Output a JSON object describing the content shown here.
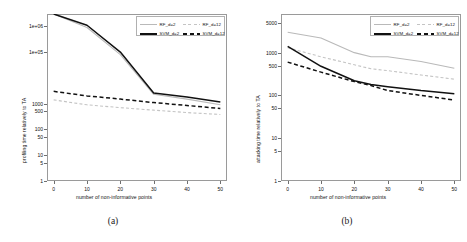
{
  "figure": {
    "panels": [
      {
        "caption": "(a)",
        "xlabel": "number of non-informative points",
        "ylabel": "profiling time relatively to TA",
        "xticks": [
          "0",
          "10",
          "20",
          "30",
          "40",
          "50"
        ],
        "yticks": [
          "1",
          "5",
          "10",
          "50",
          "100",
          "500",
          "1000",
          "1e+05",
          "1e+06"
        ]
      },
      {
        "caption": "(b)",
        "xlabel": "number of non-informative points",
        "ylabel": "attacking time relatively to TA",
        "xticks": [
          "0",
          "10",
          "20",
          "30",
          "40",
          "50"
        ],
        "yticks": [
          "1",
          "5",
          "10",
          "50",
          "100",
          "500",
          "1000",
          "5000"
        ]
      }
    ],
    "legend": {
      "entries": [
        {
          "label": "RF_d=2",
          "color": "#b9b9b9",
          "style": "solid"
        },
        {
          "label": "RF_d=12",
          "color": "#c4c4c4",
          "style": "dashed"
        },
        {
          "label": "SVM_d=2",
          "color": "#111111",
          "style": "solid"
        },
        {
          "label": "SVM_d=12",
          "color": "#111111",
          "style": "dashed"
        }
      ]
    }
  },
  "chart_data": [
    {
      "type": "line",
      "title": "(a)",
      "xlabel": "number of non-informative points",
      "ylabel": "profiling time relatively to TA",
      "xlim": [
        -2,
        52
      ],
      "ylim": [
        1,
        3000000
      ],
      "yscale": "log",
      "grid": false,
      "legend_position": "top-right",
      "x": [
        0,
        10,
        20,
        30,
        40,
        50
      ],
      "series": [
        {
          "name": "RF_d=2",
          "color": "#b9b9b9",
          "style": "solid",
          "values": [
            3000000,
            900000,
            80000,
            2300,
            1500,
            900
          ]
        },
        {
          "name": "RF_d=12",
          "color": "#c4c4c4",
          "style": "dashed",
          "values": [
            1400,
            900,
            700,
            560,
            450,
            380
          ]
        },
        {
          "name": "SVM_d=2",
          "color": "#111111",
          "style": "solid",
          "values": [
            3000000,
            1100000,
            100000,
            2600,
            1800,
            1150
          ]
        },
        {
          "name": "SVM_d=12",
          "color": "#111111",
          "style": "dashed",
          "values": [
            3000,
            2000,
            1500,
            1100,
            850,
            650
          ]
        }
      ]
    },
    {
      "type": "line",
      "title": "(b)",
      "xlabel": "number of non-informative points",
      "ylabel": "attacking time relatively to TA",
      "xlim": [
        -2,
        52
      ],
      "ylim": [
        1,
        8000
      ],
      "yscale": "log",
      "grid": false,
      "legend_position": "top-right",
      "x": [
        0,
        10,
        20,
        25,
        30,
        40,
        50
      ],
      "series": [
        {
          "name": "RF_d=2",
          "color": "#b9b9b9",
          "style": "solid",
          "values": [
            3000,
            2200,
            1000,
            800,
            800,
            620,
            430
          ]
        },
        {
          "name": "RF_d=12",
          "color": "#c4c4c4",
          "style": "dashed",
          "values": [
            1300,
            800,
            520,
            420,
            380,
            300,
            240
          ]
        },
        {
          "name": "SVM_d=2",
          "color": "#111111",
          "style": "solid",
          "values": [
            1400,
            480,
            220,
            180,
            160,
            130,
            110
          ]
        },
        {
          "name": "SVM_d=12",
          "color": "#111111",
          "style": "dashed",
          "values": [
            600,
            350,
            210,
            170,
            130,
            100,
            78
          ]
        }
      ]
    }
  ]
}
